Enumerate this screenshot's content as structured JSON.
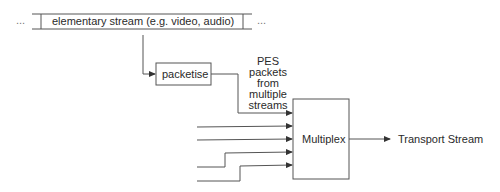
{
  "stream_bar": {
    "label": "elementary stream (e.g. video, audio)",
    "left_ellipsis": "...",
    "right_ellipsis": "..."
  },
  "packetise": {
    "label": "packetise"
  },
  "pes_note": {
    "lines": [
      "PES",
      "packets",
      "from",
      "multiple",
      "streams"
    ]
  },
  "multiplex": {
    "label": "Multiplex"
  },
  "output": {
    "label": "Transport Stream"
  },
  "colors": {
    "line": "#444444",
    "text": "#2a2a2a"
  }
}
